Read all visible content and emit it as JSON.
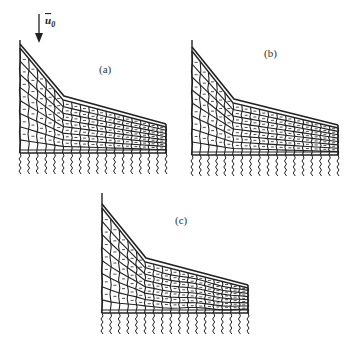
{
  "figure": {
    "load": {
      "symbol": "u",
      "subscript": "0",
      "direction": "down",
      "icon": "arrow-down-icon"
    },
    "panels": [
      {
        "id": "a",
        "label": "(a)",
        "left_x": 20,
        "top_y": 40,
        "crest_y": 48,
        "knee": [
          63,
          100
        ],
        "right_end": [
          166,
          127
        ],
        "base_y": 153,
        "pile_bottom": 175,
        "cols_steep": 5,
        "cols_gentle": 12,
        "rows": 7
      },
      {
        "id": "b",
        "label": "(b)",
        "left_x": 192,
        "top_y": 40,
        "crest_y": 51,
        "knee": [
          233,
          103
        ],
        "right_end": [
          338,
          128
        ],
        "base_y": 155,
        "pile_bottom": 176,
        "cols_steep": 5,
        "cols_gentle": 12,
        "rows": 7
      },
      {
        "id": "c",
        "label": "(c)",
        "left_x": 102,
        "top_y": 193,
        "crest_y": 208,
        "knee": [
          145,
          262
        ],
        "right_end": [
          248,
          288
        ],
        "base_y": 313,
        "pile_bottom": 335,
        "cols_steep": 5,
        "cols_gentle": 12,
        "rows": 7
      }
    ],
    "colors": {
      "line": "#222222",
      "background": "#ffffff"
    }
  }
}
